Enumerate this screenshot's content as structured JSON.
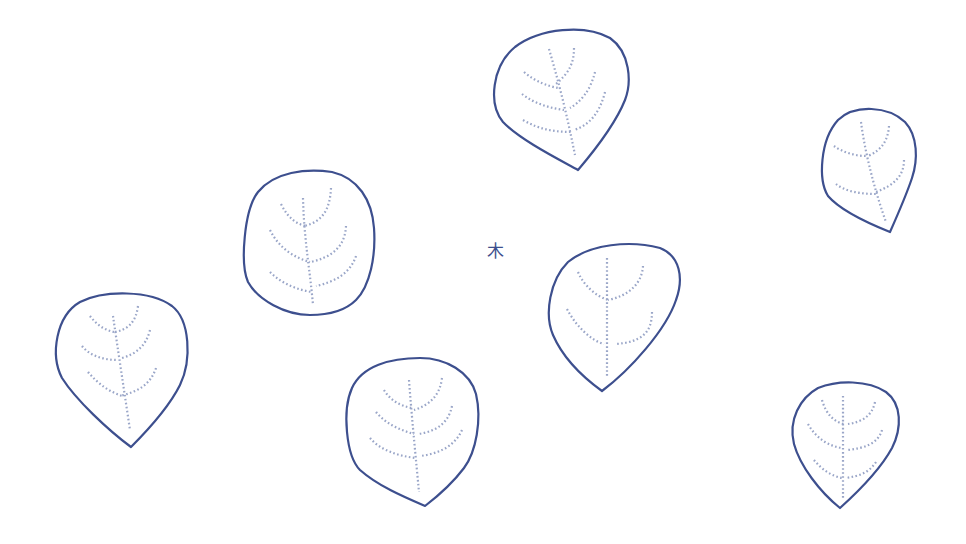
{
  "center_label": "木",
  "colors": {
    "outline": "#3d4f8e",
    "vein": "#9aa6c8",
    "background": "#ffffff"
  },
  "leaves": [
    {
      "id": "leaf-top-center",
      "shape": "leaf-pointed-bottom",
      "count_veins": 3
    },
    {
      "id": "leaf-top-right",
      "shape": "leaf-pointed-bottom",
      "count_veins": 2
    },
    {
      "id": "leaf-left-oval",
      "shape": "rounded-oval",
      "count_veins": 3
    },
    {
      "id": "leaf-center-right",
      "shape": "leaf-pointed-bottom",
      "count_veins": 2
    },
    {
      "id": "leaf-bottom-left",
      "shape": "leaf-pointed-bottom",
      "count_veins": 3
    },
    {
      "id": "leaf-bottom-center",
      "shape": "leaf-pointed-bottom",
      "count_veins": 3
    },
    {
      "id": "leaf-bottom-right",
      "shape": "leaf-pointed-bottom",
      "count_veins": 3
    }
  ]
}
